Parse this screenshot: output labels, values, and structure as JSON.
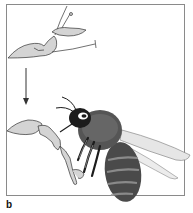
{
  "figure": {
    "panel_label": "b",
    "elements": [
      {
        "name": "flower-closed",
        "description": "flower before visit (top)"
      },
      {
        "name": "arrow-down",
        "description": "transition arrow"
      },
      {
        "name": "flower-open",
        "description": "flower being visited (bottom)"
      },
      {
        "name": "bee",
        "description": "bee probing flower"
      }
    ],
    "colors": {
      "frame": "#8a8a8a",
      "petal_fill": "#d4d4d4",
      "outline": "#333333",
      "bee_dark": "#1c1c1c",
      "bee_mid": "#6a6a6a",
      "wing": "#e6e6e6"
    }
  }
}
